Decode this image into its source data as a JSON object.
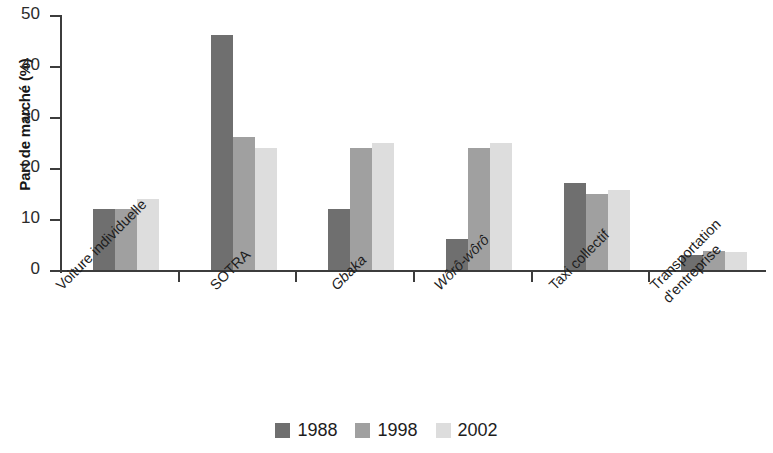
{
  "chart_data": {
    "type": "bar",
    "title": "",
    "subtitle": "",
    "xlabel": "",
    "ylabel": "Part de marché (%)",
    "ylim": [
      0,
      50
    ],
    "yticks": [
      0,
      10,
      20,
      30,
      40,
      50
    ],
    "grid": false,
    "legend_position": "bottom-center",
    "categories": [
      "Voiture individuelle",
      "SOTRA",
      "Gbaka",
      "Wôrô-wôrô",
      "Taxi collectif",
      "Transportation d'entreprise"
    ],
    "series": [
      {
        "name": "1988",
        "color": "#6f6f6f",
        "values": [
          12,
          46,
          12,
          6,
          17,
          3
        ]
      },
      {
        "name": "1998",
        "color": "#a0a0a0",
        "values": [
          12,
          26,
          24,
          24,
          15,
          3.8
        ]
      },
      {
        "name": "2002",
        "color": "#dddddd",
        "values": [
          14,
          24,
          25,
          25,
          15.7,
          3.6
        ]
      }
    ]
  },
  "axis": {
    "y_title": "Part de marché (%)",
    "y_tick_labels": [
      "0",
      "10",
      "20",
      "30",
      "40",
      "50"
    ]
  },
  "x_labels": [
    {
      "line1": "Voiture individuelle",
      "line2": "",
      "italic": false
    },
    {
      "line1": "SOTRA",
      "line2": "",
      "italic": false
    },
    {
      "line1": "Gbaka",
      "line2": "",
      "italic": true
    },
    {
      "line1": "Wôrô-wôrô",
      "line2": "",
      "italic": true
    },
    {
      "line1": "Taxi collectif",
      "line2": "",
      "italic": false
    },
    {
      "line1": "Transportation",
      "line2": "d'entreprise",
      "italic": false
    }
  ],
  "legend": {
    "items": [
      {
        "label": "1988",
        "color": "#6f6f6f"
      },
      {
        "label": "1998",
        "color": "#a0a0a0"
      },
      {
        "label": "2002",
        "color": "#dddddd"
      }
    ]
  }
}
